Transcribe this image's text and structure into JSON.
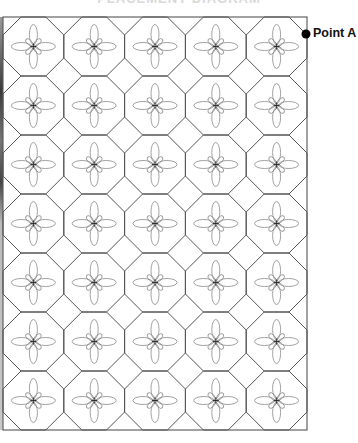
{
  "title": "PLACEMENT DIAGRAM",
  "diagram": {
    "type": "octagon-square quilt tiling",
    "columns": 5,
    "rows": 7,
    "grid": {
      "left": 3,
      "top": 17,
      "right": 307,
      "bottom": 430
    },
    "corner_cut": 18,
    "line_color": "#555555",
    "motif_color": "#8a8a8a",
    "motif": "four-petal flower with small diagonal petals and center cross"
  },
  "marker": {
    "label": "Point A",
    "x": 306,
    "y": 34,
    "color": "#000000"
  }
}
